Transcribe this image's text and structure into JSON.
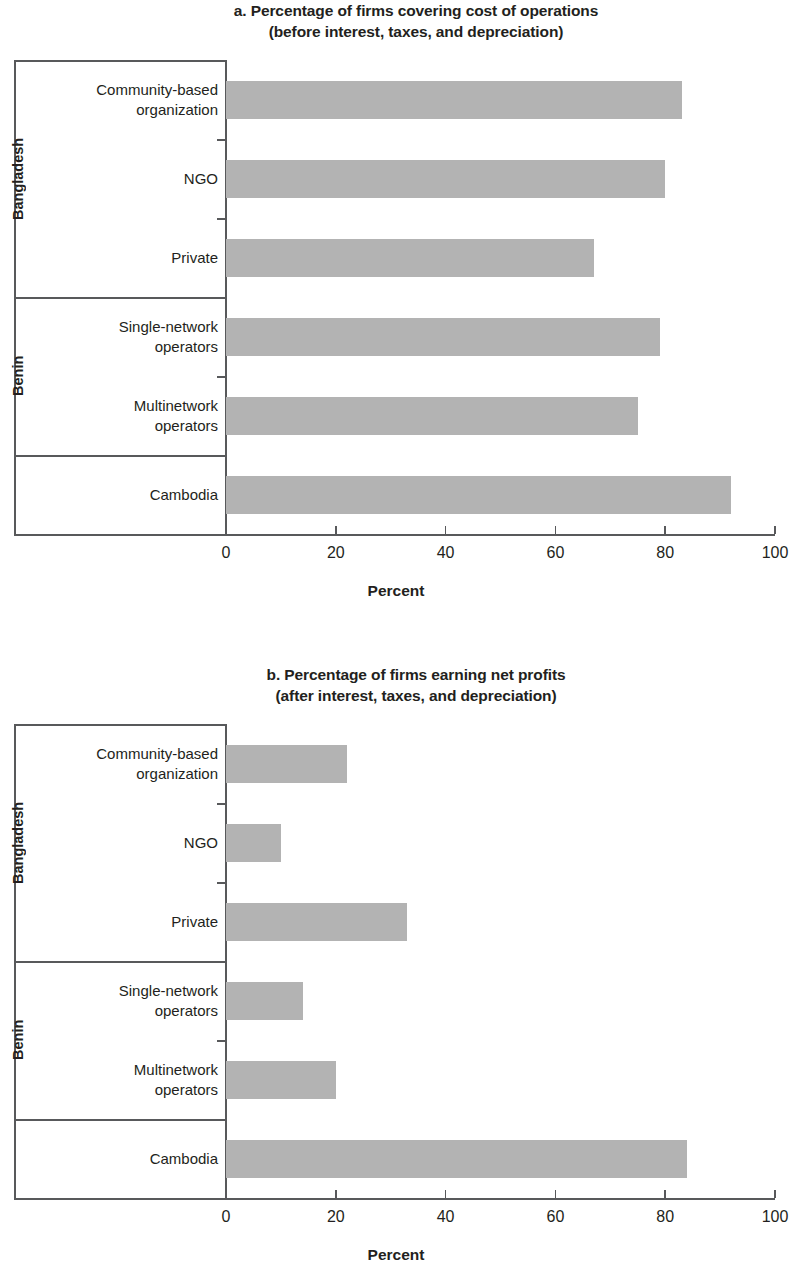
{
  "figure": {
    "axis_title": "Percent",
    "bar_color": "#b3b3b3",
    "axis_color": "#58595b",
    "text_color": "#231f20"
  },
  "panels": [
    {
      "id": "a",
      "title_line1": "a. Percentage of firms covering cost of operations",
      "title_line2": "(before interest, taxes, and depreciation)",
      "groups": [
        {
          "label": "Bangladesh",
          "categories": [
            {
              "line1": "Community-based",
              "line2": "organization",
              "value": 83
            },
            {
              "line1": "NGO",
              "line2": "",
              "value": 80
            },
            {
              "line1": "Private",
              "line2": "",
              "value": 67
            }
          ]
        },
        {
          "label": "Benin",
          "categories": [
            {
              "line1": "Single-network",
              "line2": "operators",
              "value": 79
            },
            {
              "line1": "Multinetwork",
              "line2": "operators",
              "value": 75
            }
          ]
        },
        {
          "label": "",
          "categories": [
            {
              "line1": "Cambodia",
              "line2": "",
              "value": 92
            }
          ]
        }
      ],
      "axis": {
        "ticks": [
          "0",
          "20",
          "40",
          "60",
          "80",
          "100"
        ],
        "min": 0,
        "max": 100,
        "title": "Percent"
      }
    },
    {
      "id": "b",
      "title_line1": "b. Percentage of firms earning net profits",
      "title_line2": "(after interest, taxes, and depreciation)",
      "groups": [
        {
          "label": "Bangladesh",
          "categories": [
            {
              "line1": "Community-based",
              "line2": "organization",
              "value": 22
            },
            {
              "line1": "NGO",
              "line2": "",
              "value": 10
            },
            {
              "line1": "Private",
              "line2": "",
              "value": 33
            }
          ]
        },
        {
          "label": "Benin",
          "categories": [
            {
              "line1": "Single-network",
              "line2": "operators",
              "value": 14
            },
            {
              "line1": "Multinetwork",
              "line2": "operators",
              "value": 20
            }
          ]
        },
        {
          "label": "",
          "categories": [
            {
              "line1": "Cambodia",
              "line2": "",
              "value": 84
            }
          ]
        }
      ],
      "axis": {
        "ticks": [
          "0",
          "20",
          "40",
          "60",
          "80",
          "100"
        ],
        "min": 0,
        "max": 100,
        "title": "Percent"
      }
    }
  ],
  "chart_data": [
    {
      "type": "bar",
      "orientation": "horizontal",
      "title": "a. Percentage of firms covering cost of operations (before interest, taxes, and depreciation)",
      "xlabel": "Percent",
      "ylabel": "",
      "xlim": [
        0,
        100
      ],
      "xticks": [
        0,
        20,
        40,
        60,
        80,
        100
      ],
      "grid": false,
      "legend": "none",
      "categories": [
        "Bangladesh — Community-based organization",
        "Bangladesh — NGO",
        "Bangladesh — Private",
        "Benin — Single-network operators",
        "Benin — Multinetwork operators",
        "Cambodia"
      ],
      "values": [
        83,
        80,
        67,
        79,
        75,
        92
      ]
    },
    {
      "type": "bar",
      "orientation": "horizontal",
      "title": "b. Percentage of firms earning net profits (after interest, taxes, and depreciation)",
      "xlabel": "Percent",
      "ylabel": "",
      "xlim": [
        0,
        100
      ],
      "xticks": [
        0,
        20,
        40,
        60,
        80,
        100
      ],
      "grid": false,
      "legend": "none",
      "categories": [
        "Bangladesh — Community-based organization",
        "Bangladesh — NGO",
        "Bangladesh — Private",
        "Benin — Single-network operators",
        "Benin — Multinetwork operators",
        "Cambodia"
      ],
      "values": [
        22,
        10,
        33,
        14,
        20,
        84
      ]
    }
  ]
}
